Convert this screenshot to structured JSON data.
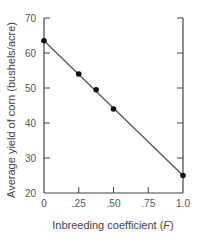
{
  "chart_data": {
    "type": "line",
    "title": "",
    "xlabel": "Inbreeding coefficient (F)",
    "xlabel_parts": {
      "prefix": "Inbreeding coefficient (",
      "var": "F",
      "suffix": ")"
    },
    "ylabel": "Average yield of corn (bushels/acre)",
    "xlim": [
      0,
      1.0
    ],
    "ylim": [
      20,
      70
    ],
    "x_ticks": [
      0,
      0.25,
      0.5,
      0.75,
      1.0
    ],
    "x_tick_labels": [
      "0",
      ".25",
      ".50",
      ".75",
      "1.0"
    ],
    "y_ticks": [
      20,
      30,
      40,
      50,
      60,
      70
    ],
    "y_tick_labels": [
      "20",
      "30",
      "40",
      "50",
      "60",
      "70"
    ],
    "grid": false,
    "legend": null,
    "series": [
      {
        "name": "Observed yield",
        "points": [
          {
            "x": 0,
            "y": 63.5
          },
          {
            "x": 0.25,
            "y": 54
          },
          {
            "x": 0.375,
            "y": 49.5
          },
          {
            "x": 0.5,
            "y": 44
          },
          {
            "x": 1.0,
            "y": 25
          }
        ]
      }
    ],
    "fit_line": {
      "x0": 0,
      "y0": 63.5,
      "x1": 1.0,
      "y1": 25
    },
    "colors": {
      "line": "#555555",
      "points": "#111111",
      "axis": "#444444"
    }
  }
}
